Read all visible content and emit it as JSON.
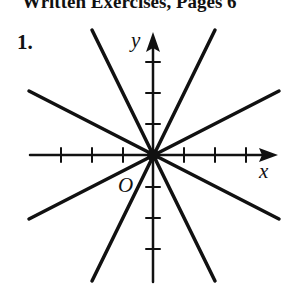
{
  "heading": "Written Exercises, Pages 6",
  "exercise_number": "1.",
  "graph": {
    "x_label": "x",
    "y_label": "y",
    "origin_label": "O",
    "ticks_per_side": 3,
    "lines": [
      {
        "equation": "y = 2x",
        "slope": 2
      },
      {
        "equation": "y = -2x",
        "slope": -2
      },
      {
        "equation": "y = 0.5x",
        "slope": 0.5
      },
      {
        "equation": "y = -0.5x",
        "slope": -0.5
      }
    ],
    "color": "#111111"
  }
}
